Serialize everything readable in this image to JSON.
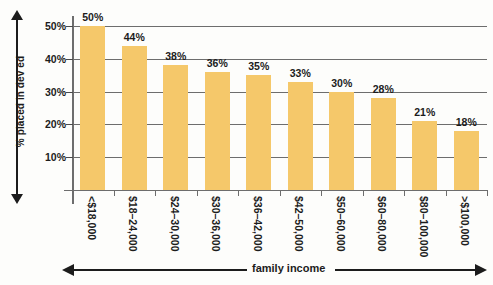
{
  "chart_data": {
    "type": "bar",
    "title": "",
    "xlabel": "family income",
    "ylabel": "% placed in dev ed",
    "categories": [
      "<$18,000",
      "$18–24,000",
      "$24–30,000",
      "$30–36,000",
      "$36–42,000",
      "$42–50,000",
      "$50–60,000",
      "$60–80,000",
      "$80–100,000",
      ">$100,000"
    ],
    "values": [
      50,
      44,
      38,
      36,
      35,
      33,
      30,
      28,
      21,
      18
    ],
    "value_labels": [
      "50%",
      "44%",
      "38%",
      "36%",
      "35%",
      "33%",
      "30%",
      "28%",
      "21%",
      "18%"
    ],
    "ylim": [
      0,
      53
    ],
    "ytick_values": [
      10,
      20,
      30,
      40,
      50
    ],
    "ytick_labels": [
      "10%",
      "20%",
      "30%",
      "40%",
      "50%"
    ],
    "grid": "horizontal",
    "legend": "none",
    "bar_color": "#f5c86a",
    "axis_color": "#6d6d6d",
    "text_color": "#1c1c1c",
    "background_color": "#fdfdfb"
  }
}
